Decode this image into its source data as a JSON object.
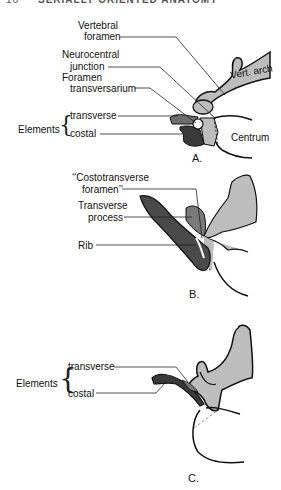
{
  "header": {
    "page_number": "16",
    "running_title": "SERIALLY ORIENTED ANATOMY"
  },
  "panels": [
    {
      "id": "A",
      "panel_label": "A.",
      "labels": {
        "vertebral_foramen_1": "Vertebral",
        "vertebral_foramen_2": "foramen",
        "neurocentral_1": "Neurocentral",
        "neurocentral_2": "junction",
        "foramen_transv_1": "Foramen",
        "foramen_transv_2": "transversarium",
        "elements": "Elements",
        "transverse": "transverse",
        "costal": "costal",
        "vert_arch": "Vert. arch",
        "centrum": "Centrum"
      }
    },
    {
      "id": "B",
      "panel_label": "B.",
      "labels": {
        "costotransverse_1": "‘‘Costotransverse",
        "costotransverse_2": "foramen’’",
        "transverse_process_1": "Transverse",
        "transverse_process_2": "process",
        "rib": "Rib"
      }
    },
    {
      "id": "C",
      "panel_label": "C.",
      "labels": {
        "elements": "Elements",
        "transverse": "transverse",
        "costal": "costal"
      }
    }
  ],
  "colors": {
    "light_bone": "#bdbdbd",
    "dark_bone": "#4a4a4a",
    "mid_bone": "#7a7a7a",
    "outline": "#111111"
  }
}
